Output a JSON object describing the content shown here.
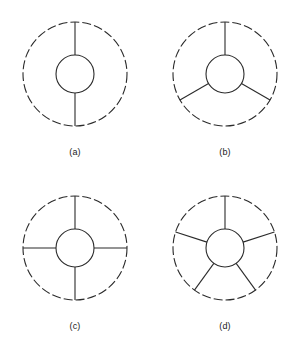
{
  "page": {
    "background_color": "#ffffff",
    "stroke_color": "#2b2b2b",
    "caption_color": "#1a1a1a"
  },
  "figure": {
    "kind": "spoke-diagram-set",
    "geometry": {
      "outer_radius": 52,
      "inner_radius": 19,
      "outer_dash_pattern": "9 3",
      "stroke_width": 1.1,
      "center_x": 70,
      "center_y": 68
    },
    "panels": [
      {
        "id": "panel-a",
        "caption": "(a)",
        "spoke_count": 2,
        "spoke_angles_deg": [
          90,
          270
        ],
        "inner_style": "solid",
        "outer_style": "dashed"
      },
      {
        "id": "panel-b",
        "caption": "(b)",
        "spoke_count": 3,
        "spoke_angles_deg": [
          90,
          210,
          330
        ],
        "inner_style": "solid",
        "outer_style": "dashed"
      },
      {
        "id": "panel-c",
        "caption": "(c)",
        "spoke_count": 4,
        "spoke_angles_deg": [
          90,
          180,
          270,
          0
        ],
        "inner_style": "solid",
        "outer_style": "dashed"
      },
      {
        "id": "panel-d",
        "caption": "(d)",
        "spoke_count": 5,
        "spoke_angles_deg": [
          90,
          162,
          234,
          306,
          18
        ],
        "inner_style": "solid",
        "outer_style": "dashed"
      }
    ]
  }
}
